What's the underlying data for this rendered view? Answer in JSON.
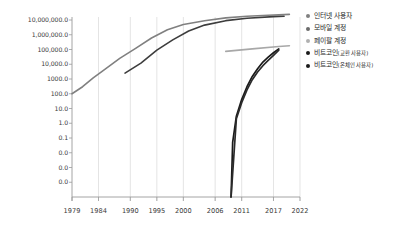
{
  "chart_data": {
    "type": "line",
    "title": "",
    "xlabel": "",
    "ylabel": "",
    "yscale": "log",
    "grid": "vertical",
    "legend_position": "right",
    "x_ticks": [
      "1979",
      "1984",
      "1990",
      "1995",
      "2000",
      "2006",
      "2011",
      "2017",
      "2022"
    ],
    "y_ticks": [
      "10,000,000.0",
      "1,000,000.0",
      "100,000.0",
      "10,000.0",
      "1000.0",
      "100.0",
      "10.0",
      "1.0",
      "0.1",
      "0.0",
      "0.0",
      "0.0"
    ],
    "ylim": [
      0.0,
      10000000.0
    ],
    "xlim": [
      1979,
      2022
    ],
    "series": [
      {
        "name": "인터넷 사용자",
        "color": "#808080",
        "points": [
          [
            1979,
            100
          ],
          [
            1981,
            300
          ],
          [
            1983,
            1200
          ],
          [
            1985,
            4000
          ],
          [
            1988,
            25000
          ],
          [
            1991,
            120000
          ],
          [
            1994,
            600000
          ],
          [
            1997,
            2200000
          ],
          [
            2000,
            5000000
          ],
          [
            2004,
            9000000
          ],
          [
            2008,
            14000000
          ],
          [
            2012,
            18000000
          ],
          [
            2017,
            22000000
          ],
          [
            2020,
            24000000
          ]
        ]
      },
      {
        "name": "모바일 계정",
        "color": "#3d3d3d",
        "points": [
          [
            1989,
            2500
          ],
          [
            1992,
            12000
          ],
          [
            1995,
            90000
          ],
          [
            1998,
            450000
          ],
          [
            2001,
            1800000
          ],
          [
            2004,
            4500000
          ],
          [
            2008,
            9000000
          ],
          [
            2012,
            13000000
          ],
          [
            2017,
            17000000
          ],
          [
            2019,
            18000000
          ]
        ]
      },
      {
        "name": "페이팔 계정",
        "color": "#a8a8a8",
        "points": [
          [
            2008,
            75000
          ],
          [
            2013,
            110000
          ],
          [
            2018,
            160000
          ],
          [
            2020,
            180000
          ]
        ]
      },
      {
        "name": "비트코인(교환 사용자)",
        "color": "#1a1a1a",
        "points": [
          [
            2009,
            0.0
          ],
          [
            2009.3,
            0.05
          ],
          [
            2010,
            3
          ],
          [
            2011,
            40
          ],
          [
            2012,
            300
          ],
          [
            2013,
            1500
          ],
          [
            2014,
            5000
          ],
          [
            2015,
            14000
          ],
          [
            2016,
            30000
          ],
          [
            2017,
            60000
          ],
          [
            2018,
            110000
          ]
        ]
      },
      {
        "name": "비트코인(온체인 사용자)",
        "color": "#2b2b2b",
        "points": [
          [
            2009,
            0.0
          ],
          [
            2010,
            2
          ],
          [
            2011,
            25
          ],
          [
            2012,
            180
          ],
          [
            2013,
            900
          ],
          [
            2014,
            3000
          ],
          [
            2015,
            8000
          ],
          [
            2016,
            18000
          ],
          [
            2017,
            40000
          ],
          [
            2018,
            90000
          ]
        ]
      }
    ],
    "legend": [
      {
        "label": "인터넷 사용자",
        "label_main": "인터넷 사용자",
        "label_paren": "",
        "color": "#808080"
      },
      {
        "label": "모바일 계정",
        "label_main": "모바일 계정",
        "label_paren": "",
        "color": "#6b6b6b"
      },
      {
        "label": "페이팔 계정",
        "label_main": "페이팔 계정",
        "label_paren": "",
        "color": "#b0b0b0"
      },
      {
        "label": "비트코인(교환 사용자)",
        "label_main": "비트코인",
        "label_paren": "(교환 사용자)",
        "color": "#1a1a1a"
      },
      {
        "label": "비트코인(온체인 사용자)",
        "label_main": "비트코인",
        "label_paren": "(온체인 사용자)",
        "color": "#1a1a1a"
      }
    ]
  }
}
